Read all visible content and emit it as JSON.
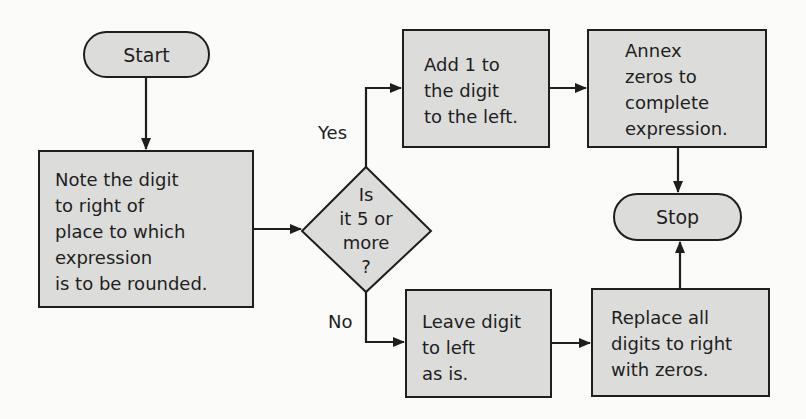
{
  "diagram": {
    "type": "flowchart",
    "colors": {
      "node_fill": "#dcdcda",
      "stroke": "#1e1e1e",
      "background": "#fbfbf9"
    },
    "nodes": {
      "start": {
        "shape": "terminal",
        "label": "Start"
      },
      "note": {
        "shape": "process",
        "lines": [
          "Note the digit",
          "to right of",
          "place to which",
          "expression",
          "is to be rounded."
        ]
      },
      "decision": {
        "shape": "decision",
        "lines": [
          "Is",
          "it 5 or",
          "more",
          "?"
        ]
      },
      "add": {
        "shape": "process",
        "lines": [
          "Add 1 to",
          "the digit",
          "to the left."
        ]
      },
      "annex": {
        "shape": "process",
        "lines": [
          "Annex",
          "zeros to",
          "complete",
          "expression."
        ]
      },
      "stop": {
        "shape": "terminal",
        "label": "Stop"
      },
      "leave": {
        "shape": "process",
        "lines": [
          "Leave digit",
          "to left",
          "as is."
        ]
      },
      "replace": {
        "shape": "process",
        "lines": [
          "Replace all",
          "digits to right",
          "with zeros."
        ]
      }
    },
    "edges": [
      {
        "from": "start",
        "to": "note",
        "label": ""
      },
      {
        "from": "note",
        "to": "decision",
        "label": ""
      },
      {
        "from": "decision",
        "to": "add",
        "label": "Yes"
      },
      {
        "from": "decision",
        "to": "leave",
        "label": "No"
      },
      {
        "from": "add",
        "to": "annex",
        "label": ""
      },
      {
        "from": "annex",
        "to": "stop",
        "label": ""
      },
      {
        "from": "leave",
        "to": "replace",
        "label": ""
      },
      {
        "from": "replace",
        "to": "stop",
        "label": ""
      }
    ],
    "labels": {
      "yes": "Yes",
      "no": "No"
    }
  }
}
